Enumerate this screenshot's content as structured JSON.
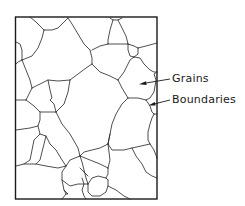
{
  "figure": {
    "type": "grain-microstructure-schematic",
    "labels": [
      {
        "id": "grains",
        "text": "Grains"
      },
      {
        "id": "boundaries",
        "text": "Boundaries"
      }
    ]
  },
  "colors": {
    "line": "#1a1a1a",
    "background": "#ffffff"
  }
}
